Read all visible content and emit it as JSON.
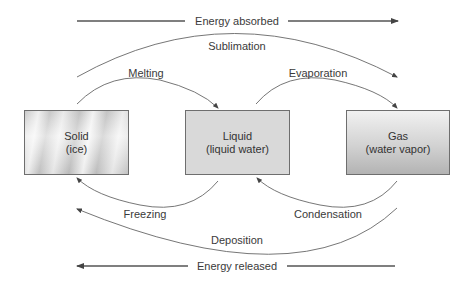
{
  "diagram": {
    "energy_absorbed": {
      "label": "Energy absorbed",
      "direction": "right"
    },
    "energy_released": {
      "label": "Energy released",
      "direction": "left"
    },
    "states": [
      {
        "name": "Solid",
        "detail": "(ice)"
      },
      {
        "name": "Liquid",
        "detail": "(liquid water)"
      },
      {
        "name": "Gas",
        "detail": "(water vapor)"
      }
    ],
    "transitions": {
      "sublimation": "Sublimation",
      "melting": "Melting",
      "evaporation": "Evaporation",
      "freezing": "Freezing",
      "condensation": "Condensation",
      "deposition": "Deposition"
    },
    "colors": {
      "arrow": "#555555",
      "box_border": "#6e6e6e",
      "liquid_fill": "#d9d9d9",
      "text": "#333333"
    }
  }
}
